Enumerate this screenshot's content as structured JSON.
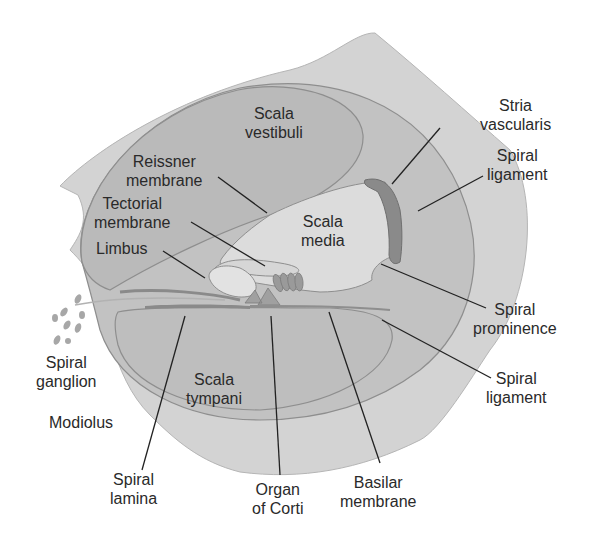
{
  "figure": {
    "colors": {
      "background": "#ffffff",
      "outer_bone": "#d3d3d3",
      "duct_wall": "#c0c0c0",
      "scala_fill": "#bdbdbd",
      "media_fill": "#dcdcdc",
      "outline": "#8e8e8e",
      "stria": "#8a8a8a",
      "leader_line": "#222222",
      "text": "#2a2a2a"
    }
  },
  "labels": {
    "scala_vestibuli": [
      "Scala",
      "vestibuli"
    ],
    "reissner_membrane": [
      "Reissner",
      "membrane"
    ],
    "tectorial_membrane": [
      "Tectorial",
      "membrane"
    ],
    "limbus": [
      "Limbus"
    ],
    "scala_media": [
      "Scala",
      "media"
    ],
    "stria_vascularis": [
      "Stria",
      "vascularis"
    ],
    "spiral_ligament_upper": [
      "Spiral",
      "ligament"
    ],
    "spiral_prominence": [
      "Spiral",
      "prominence"
    ],
    "spiral_ligament_lower": [
      "Spiral",
      "ligament"
    ],
    "spiral_ganglion": [
      "Spiral",
      "ganglion"
    ],
    "modiolus": [
      "Modiolus"
    ],
    "scala_tympani": [
      "Scala",
      "tympani"
    ],
    "spiral_lamina": [
      "Spiral",
      "lamina"
    ],
    "organ_of_corti": [
      "Organ",
      "of Corti"
    ],
    "basilar_membrane": [
      "Basilar",
      "membrane"
    ]
  }
}
